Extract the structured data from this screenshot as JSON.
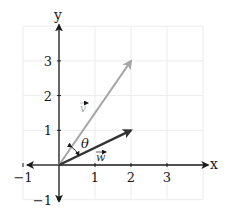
{
  "diagram": {
    "type": "vector-plot",
    "axes": {
      "x_label": "x",
      "y_label": "y",
      "x_range": [
        -1,
        4
      ],
      "y_range": [
        -1,
        4
      ],
      "x_ticks": [
        {
          "value": -1,
          "label": "−1"
        },
        {
          "value": 1,
          "label": "1"
        },
        {
          "value": 2,
          "label": "2"
        },
        {
          "value": 3,
          "label": "3"
        }
      ],
      "y_ticks": [
        {
          "value": -1,
          "label": "−1"
        },
        {
          "value": 1,
          "label": "1"
        },
        {
          "value": 2,
          "label": "2"
        },
        {
          "value": 3,
          "label": "3"
        }
      ],
      "grid": true
    },
    "vectors": [
      {
        "name": "v",
        "label": "v",
        "from": [
          0,
          0
        ],
        "to": [
          2,
          3
        ],
        "color": "#a6a6a6"
      },
      {
        "name": "w",
        "label": "w",
        "from": [
          0,
          0
        ],
        "to": [
          2,
          1
        ],
        "color": "#333333"
      }
    ],
    "angle": {
      "label": "θ",
      "between": [
        "w",
        "v"
      ]
    },
    "colors": {
      "axis": "#1a1a1a",
      "grid": "#ececec",
      "background": "#ffffff"
    }
  }
}
